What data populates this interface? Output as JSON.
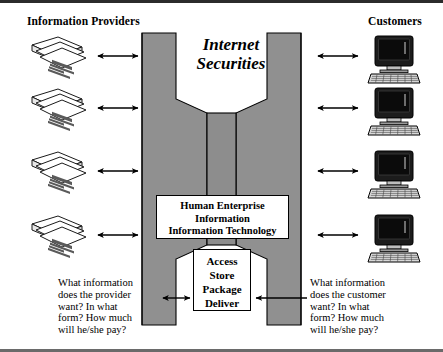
{
  "diagram": {
    "title": "Internet Securities",
    "title_lines": [
      "Internet",
      "Securities"
    ],
    "headings": {
      "left": "Information Providers",
      "right": "Customers"
    },
    "center_boxes": [
      {
        "id": "human-enterprise-box",
        "lines": [
          "Human Enterprise",
          "Information",
          "Information Technology"
        ]
      },
      {
        "id": "access-store-box",
        "lines": [
          "Access",
          "Store",
          "Package",
          "Deliver"
        ]
      }
    ],
    "questions": {
      "left": {
        "lines": [
          "What information",
          "does the provider",
          "want? In what",
          "form? How much",
          "will he/she pay?"
        ]
      },
      "right": {
        "lines": [
          "What information",
          "does the customer",
          "want? In what",
          "form? How much",
          "will he/she pay?"
        ]
      }
    },
    "left_nodes": [
      {
        "icon": "document-stack-icon",
        "index": 1
      },
      {
        "icon": "document-stack-icon",
        "index": 2
      },
      {
        "icon": "document-stack-icon",
        "index": 3
      },
      {
        "icon": "document-stack-icon",
        "index": 4
      }
    ],
    "right_nodes": [
      {
        "icon": "desktop-computer-icon",
        "index": 1
      },
      {
        "icon": "desktop-computer-icon",
        "index": 2
      },
      {
        "icon": "desktop-computer-icon",
        "index": 3
      },
      {
        "icon": "desktop-computer-icon",
        "index": 4
      }
    ],
    "connectors": {
      "left_arrows": 4,
      "right_arrows": 4,
      "bottom_left_arrow": "double-headed-arrow",
      "bottom_right_arrow": "single-headed-arrow-left"
    },
    "colors": {
      "funnel_fill": "#909090",
      "funnel_fill_dark": "#858585",
      "outline": "#000000",
      "background": "#ffffff",
      "border_top": "#2b2b2b",
      "border_bottom": "#6a6a6a",
      "screen": "#101010",
      "paper": "#f2f2f2",
      "paper_text": "#4a4a4a"
    }
  }
}
